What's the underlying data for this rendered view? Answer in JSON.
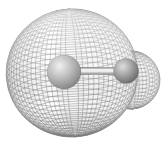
{
  "figure": {
    "canvas": {
      "width": 167,
      "height": 147
    },
    "colors": {
      "background": "#ffffff",
      "mesh_line": "#828282",
      "highlight_overlay": "#ffffff",
      "shadow_overlay": "#303030"
    },
    "mesh": {
      "tilt_deg": 18,
      "rotation_deg": -3,
      "line_width": 0.5,
      "opacity": 0.9,
      "lobes": [
        {
          "name": "large-lobe",
          "cx": 72,
          "cy": 73,
          "rx": 66,
          "ry": 64,
          "step_deg": 4.8
        },
        {
          "name": "small-lobe",
          "cx": 131,
          "cy": 80,
          "rx": 29,
          "ry": 29,
          "step_deg": 8
        }
      ]
    },
    "atoms": [
      {
        "name": "large-atom",
        "cx": 64,
        "cy": 72,
        "r": 17,
        "highlight": "#f1f1f1",
        "mid": "#b9b9b9",
        "shadow": "#6e6e6e"
      },
      {
        "name": "small-atom",
        "cx": 126,
        "cy": 71,
        "r": 12.5,
        "highlight": "#dfdfdf",
        "mid": "#a0a0a0",
        "shadow": "#555555"
      }
    ],
    "bond": {
      "x1": 72,
      "y1": 71,
      "x2": 124,
      "y2": 71,
      "thickness": 7,
      "light": "#f0f0f0",
      "edge": "#878787"
    }
  }
}
